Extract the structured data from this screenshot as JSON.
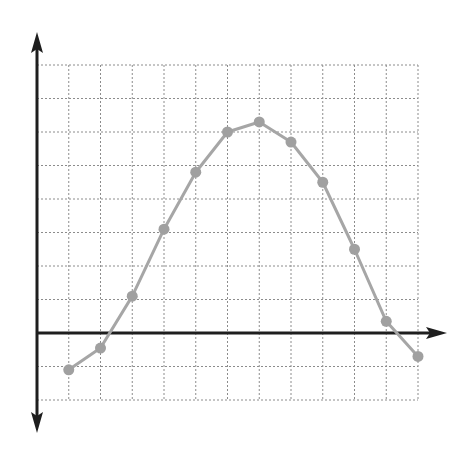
{
  "chart_data": {
    "type": "line",
    "title": "",
    "xlabel": "",
    "ylabel": "",
    "grid": true,
    "legend": null,
    "x": [
      1,
      2,
      3,
      4,
      5,
      6,
      7,
      8,
      9,
      10,
      11,
      12
    ],
    "series": [
      {
        "name": "series-1",
        "values": [
          -1.1,
          -0.45,
          1.1,
          3.1,
          4.8,
          6.0,
          6.3,
          5.7,
          4.5,
          2.5,
          0.35,
          -0.7
        ],
        "color": "#a6a6a6",
        "marker": "circle"
      }
    ],
    "xlim": [
      0,
      12
    ],
    "ylim": [
      -2,
      8
    ],
    "axes": {
      "x_axis_arrow": "right",
      "y_axis_arrow": "both",
      "tick_labels": false
    }
  },
  "style": {
    "axis_color": "#1e1e1e",
    "grid_color": "#8c8c8c",
    "line_color": "#a6a6a6",
    "marker_color": "#a0a0a0"
  },
  "layout": {
    "origin_px": [
      37,
      333
    ],
    "x_unit_px": 31.75,
    "y_unit_px": 33.5,
    "y_axis_top_px": 32,
    "y_axis_bottom_px": 433,
    "x_axis_right_px": 447
  }
}
